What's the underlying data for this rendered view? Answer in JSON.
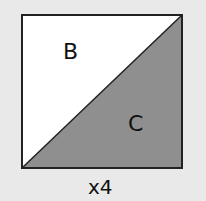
{
  "diagram": {
    "shape": "square split diagonally into two triangles",
    "regions": [
      {
        "label": "B",
        "fill": "#ffffff",
        "position": "upper-left triangle"
      },
      {
        "label": "C",
        "fill": "#8f8f8f",
        "position": "lower-right triangle"
      }
    ],
    "multiplier": "x4",
    "colors": {
      "background": "#e9e9e9",
      "outline": "#222222",
      "light_triangle": "#ffffff",
      "dark_triangle": "#8f8f8f"
    }
  }
}
